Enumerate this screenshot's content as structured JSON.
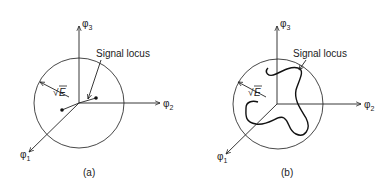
{
  "figure": {
    "panels": [
      {
        "id": "a",
        "caption": "(a)",
        "axes": {
          "x": "φ2",
          "y": "φ3",
          "z": "φ1"
        },
        "axis_sub": {
          "phi1": "1",
          "phi2": "2",
          "phi3": "3"
        },
        "phi": "φ",
        "radius_label": "E",
        "radius_sqrt": "√",
        "annotation": "Signal locus",
        "locus_type": "two points"
      },
      {
        "id": "b",
        "caption": "(b)",
        "axes": {
          "x": "φ2",
          "y": "φ3",
          "z": "φ1"
        },
        "axis_sub": {
          "phi1": "1",
          "phi2": "2",
          "phi3": "3"
        },
        "phi": "φ",
        "radius_label": "E",
        "radius_sqrt": "√",
        "annotation": "Signal locus",
        "locus_type": "curve"
      }
    ]
  }
}
